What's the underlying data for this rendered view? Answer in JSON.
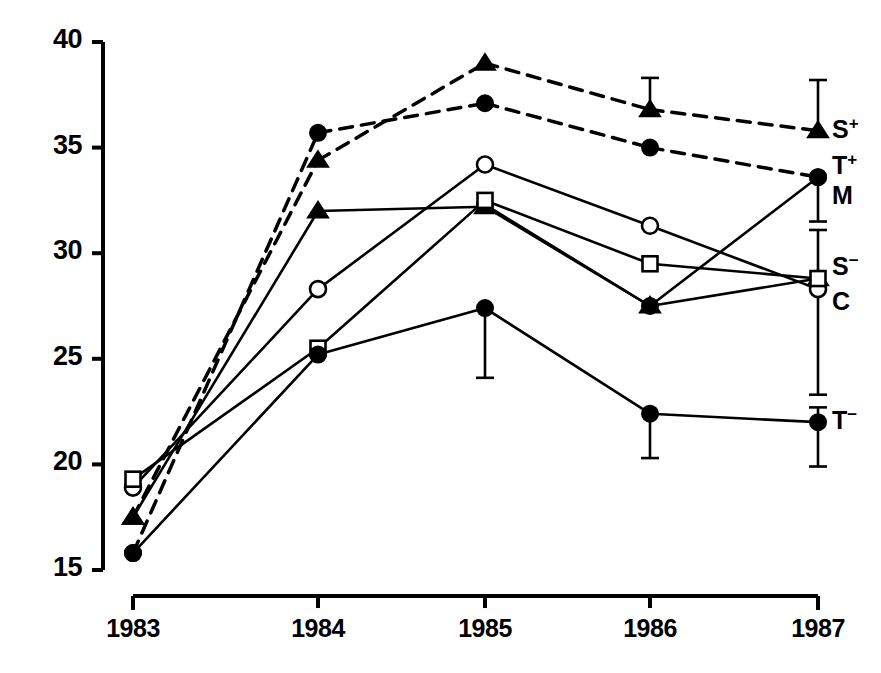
{
  "chart_data": {
    "type": "line",
    "title": "",
    "subtitle": "",
    "xlabel": "",
    "ylabel": "",
    "categories": [
      "1983",
      "1984",
      "1985",
      "1986",
      "1987"
    ],
    "x_tick_labels": [
      "1983",
      "1984",
      "1985",
      "1986",
      "1987"
    ],
    "y_tick_labels": [
      "40",
      "35",
      "30",
      "25",
      "20",
      "15"
    ],
    "y_ticks": [
      40,
      35,
      30,
      25,
      20,
      15
    ],
    "ylim": [
      15,
      40
    ],
    "grid": false,
    "legend_position": "right-inline",
    "series": [
      {
        "name": "S+",
        "label": "S",
        "superscript": "+",
        "marker": "filled-triangle",
        "line_style": "dashed",
        "values": [
          17.5,
          34.4,
          39.0,
          36.8,
          35.8
        ],
        "errors_up": [
          null,
          null,
          null,
          1.5,
          2.4
        ],
        "errors_down": [
          null,
          null,
          null,
          null,
          null
        ],
        "label_y_value": 35.8
      },
      {
        "name": "T+",
        "label": "T",
        "superscript": "+",
        "marker": "filled-circle",
        "line_style": "dashed",
        "values": [
          15.8,
          35.7,
          37.1,
          35.0,
          33.6
        ],
        "errors_up": [
          null,
          null,
          null,
          null,
          null
        ],
        "errors_down": [
          null,
          null,
          null,
          null,
          null
        ],
        "label_y_value": 34.1
      },
      {
        "name": "M",
        "label": "M",
        "superscript": "",
        "marker": "filled-circle",
        "line_style": "solid",
        "values": [
          null,
          null,
          32.3,
          27.5,
          33.6
        ],
        "errors_up": [
          null,
          null,
          null,
          null,
          null
        ],
        "errors_down": [
          null,
          null,
          null,
          null,
          2.1
        ],
        "label_y_value": 32.6
      },
      {
        "name": "S-",
        "label": "S",
        "superscript": "−",
        "marker": "filled-triangle",
        "line_style": "solid",
        "values": [
          17.5,
          32.0,
          32.2,
          27.5,
          28.8
        ],
        "errors_up": [
          null,
          null,
          null,
          null,
          2.3
        ],
        "errors_down": [
          null,
          null,
          null,
          null,
          5.5
        ],
        "label_y_value": 29.3
      },
      {
        "name": "C",
        "label": "C",
        "superscript": "",
        "marker": "open-circle",
        "line_style": "solid",
        "values": [
          18.9,
          28.3,
          34.2,
          31.3,
          28.3
        ],
        "errors_up": [
          null,
          null,
          null,
          null,
          null
        ],
        "errors_down": [
          null,
          null,
          null,
          null,
          null
        ],
        "label_y_value": 27.6
      },
      {
        "name": "open-square",
        "label": "",
        "superscript": "",
        "marker": "open-square",
        "line_style": "solid",
        "values": [
          19.3,
          25.5,
          32.5,
          29.5,
          28.8
        ],
        "errors_up": [
          null,
          null,
          null,
          null,
          null
        ],
        "errors_down": [
          null,
          null,
          null,
          null,
          null
        ],
        "label_y_value": null
      },
      {
        "name": "T-",
        "label": "T",
        "superscript": "−",
        "marker": "filled-circle",
        "line_style": "solid",
        "values": [
          15.8,
          25.2,
          27.4,
          22.4,
          22.0
        ],
        "errors_up": [
          null,
          null,
          null,
          null,
          0.7
        ],
        "errors_down": [
          null,
          null,
          3.3,
          2.1,
          2.1
        ],
        "label_y_value": 22.0
      }
    ]
  },
  "axes": {
    "y_label_x": 30,
    "x_label_y": 600,
    "axis_color": "#000000"
  },
  "legend_labels": [
    {
      "text": "S",
      "sup": "+"
    },
    {
      "text": "T",
      "sup": "+"
    },
    {
      "text": "M",
      "sup": ""
    },
    {
      "text": "S",
      "sup": "−"
    },
    {
      "text": "C",
      "sup": ""
    },
    {
      "text": "T",
      "sup": "−"
    }
  ]
}
